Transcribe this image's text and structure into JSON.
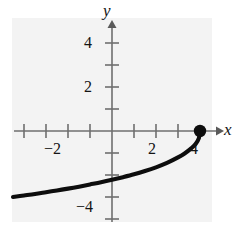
{
  "figure": {
    "background_color": "#ffffff",
    "plot_background_color": "#f3f3f3",
    "curve_color": "#0d0d0d",
    "axis_color": "#6f6f6f",
    "label_color": "#141414"
  },
  "axes": {
    "x_label": "x",
    "y_label": "y"
  },
  "chart_data": {
    "type": "line",
    "title": "",
    "subtitle": "",
    "xlabel": "x",
    "ylabel": "y",
    "xlim": [
      -4.5,
      4.5
    ],
    "ylim": [
      -5,
      5
    ],
    "grid": false,
    "legend": null,
    "x_ticks": [
      -4,
      -3,
      -2,
      -1,
      1,
      2,
      3,
      4
    ],
    "x_tick_labels": [
      "",
      "",
      "-2",
      "",
      "",
      "2",
      "",
      "4"
    ],
    "y_ticks": [
      -4,
      -3,
      -2,
      -1,
      1,
      2,
      3,
      4
    ],
    "y_tick_labels": [
      "-4",
      "",
      "",
      "",
      "",
      "2",
      "",
      "4"
    ],
    "visible_x_tick_labels": [
      "-2",
      "2",
      "4"
    ],
    "visible_y_tick_labels": [
      "4",
      "2",
      "-4"
    ],
    "series": [
      {
        "name": "curve",
        "description": "increasing concave-down curve rising from lower-left to a closed endpoint at (4, 0)",
        "x": [
          -4.5,
          -4.0,
          -3.5,
          -3.0,
          -2.5,
          -2.0,
          -1.5,
          -1.0,
          -0.5,
          0.0,
          0.5,
          1.0,
          1.5,
          2.0,
          2.5,
          3.0,
          3.3,
          3.6,
          3.8,
          3.95,
          4.0
        ],
        "y": [
          -3.0,
          -2.93,
          -2.86,
          -2.78,
          -2.7,
          -2.62,
          -2.53,
          -2.43,
          -2.33,
          -2.22,
          -2.1,
          -1.97,
          -1.82,
          -1.65,
          -1.45,
          -1.2,
          -1.02,
          -0.79,
          -0.59,
          -0.32,
          0.0
        ]
      }
    ],
    "annotations": [
      {
        "type": "point",
        "label": "closed endpoint",
        "x": 4,
        "y": 0,
        "filled": true
      }
    ]
  },
  "labels": {
    "y_axis": "y",
    "x_axis": "x",
    "x_neg2": "−2",
    "x_2": "2",
    "x_4": "4",
    "y_4": "4",
    "y_2": "2",
    "y_neg4": "−4"
  }
}
